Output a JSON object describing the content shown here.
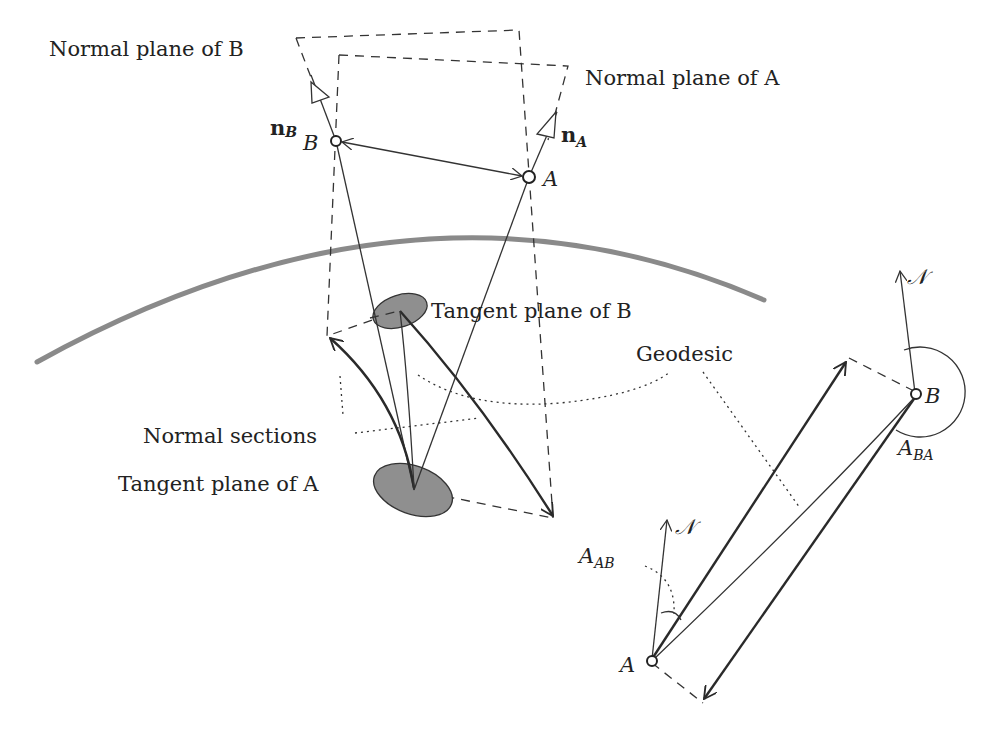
{
  "diagram": {
    "labels": {
      "normal_plane_b": "Normal plane of B",
      "normal_plane_a": "Normal plane of A",
      "tangent_plane_b": "Tangent plane of B",
      "tangent_plane_a": "Tangent plane of A",
      "normal_sections": "Normal sections",
      "geodesic": "Geodesic",
      "point_a": "A",
      "point_b": "B",
      "point_a_right": "A",
      "point_b_right": "B",
      "normal_b_vector": "n",
      "normal_b_sub": "B",
      "normal_a_vector": "n",
      "normal_a_sub": "A",
      "north_top": "𝒩",
      "north_bottom": "𝒩",
      "azimuth_ab": "A",
      "azimuth_ab_sub": "AB",
      "azimuth_ba": "A",
      "azimuth_ba_sub": "BA"
    },
    "colors": {
      "earth_curve": "#8a8a8a",
      "tangent_plane_fill": "#8f8f8f",
      "line": "#333333",
      "background": "#ffffff"
    }
  }
}
